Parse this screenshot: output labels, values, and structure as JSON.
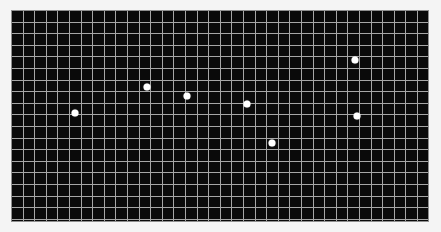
{
  "figure": {
    "width": 441,
    "height": 232,
    "background_color": "#f4f4f4",
    "title": "",
    "axes_visible": false,
    "tick_labels_visible": false
  },
  "plot": {
    "left": 11,
    "top": 10,
    "width": 418,
    "height": 212,
    "background_color": "#0a0a0a",
    "grid_color": "#a6a6a6",
    "frame_color": "#8f8f8f",
    "marker_color": "#ffffff",
    "marker_size": 7,
    "grid_cell_px": 11.6,
    "grid_columns": 36,
    "grid_rows": 18
  },
  "chart_data": {
    "type": "scatter",
    "title": "",
    "subtitle": "",
    "xlabel": "",
    "ylabel": "",
    "xlim": [
      0,
      36
    ],
    "ylim": [
      0,
      18
    ],
    "grid": true,
    "grid_both_axes": true,
    "legend": false,
    "legend_position": "none",
    "tick_labels": {
      "x": [],
      "y": []
    },
    "annotations": [],
    "series": [
      {
        "name": "points",
        "marker": "circle",
        "color": "#ffffff",
        "size": 7,
        "x": [
          5.5,
          11.7,
          15.2,
          20.3,
          22.5,
          29.6,
          29.8
        ],
        "y": [
          9.1,
          11.4,
          10.6,
          9.9,
          6.6,
          13.8,
          8.9
        ]
      }
    ],
    "points_px": [
      {
        "id": "p1",
        "x": 75,
        "y": 113
      },
      {
        "id": "p2",
        "x": 147,
        "y": 87
      },
      {
        "id": "p3",
        "x": 187,
        "y": 96
      },
      {
        "id": "p4",
        "x": 247,
        "y": 104
      },
      {
        "id": "p5",
        "x": 272,
        "y": 143
      },
      {
        "id": "p6",
        "x": 355,
        "y": 60
      },
      {
        "id": "p7",
        "x": 357,
        "y": 116
      }
    ]
  }
}
